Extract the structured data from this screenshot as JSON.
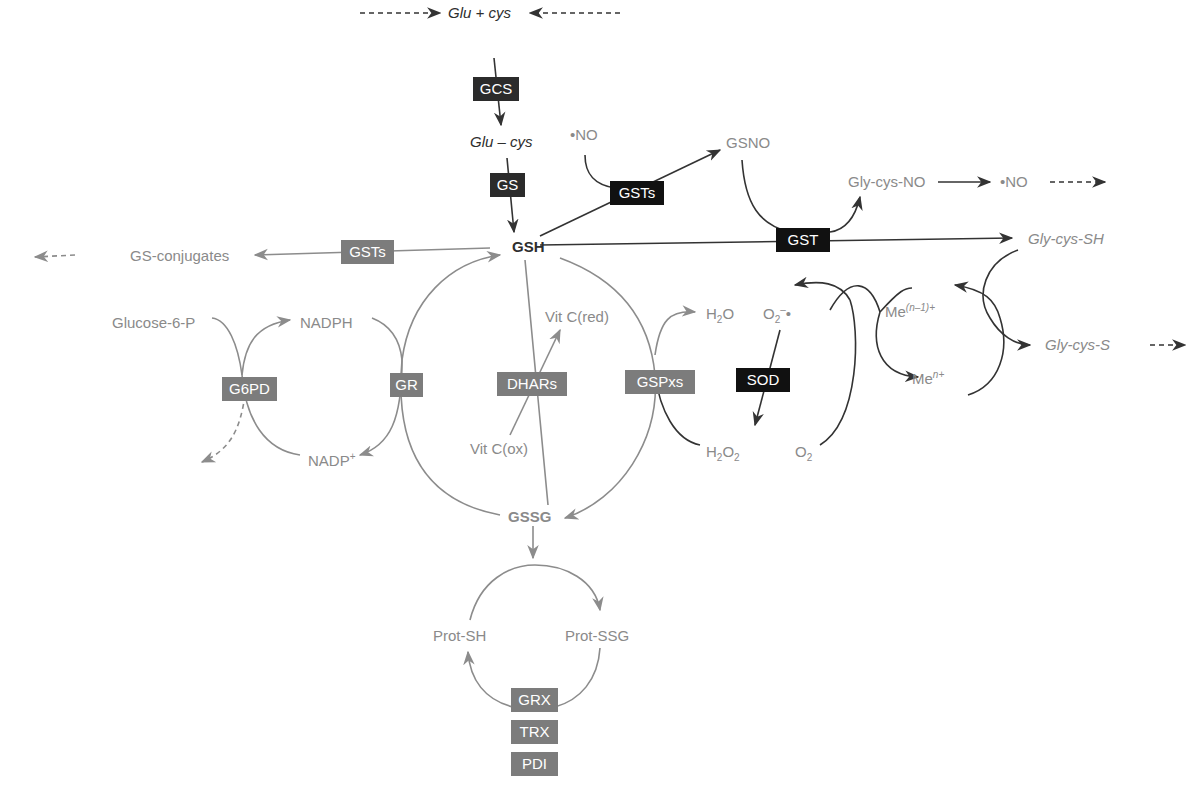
{
  "diagram": {
    "colors": {
      "dark_path": "#333333",
      "grey_path": "#8c8c8c",
      "dark_enzyme_box": "#2b2b2b",
      "grey_enzyme_box": "#7c7c7c",
      "black_enzyme_box": "#111111",
      "background": "#ffffff"
    },
    "metabolites": {
      "glu_cys": "Glu + cys",
      "glu_minus_cys": "Glu – cys",
      "no_radical_left": "•NO",
      "gsno": "GSNO",
      "gly_cys_no": "Gly-cys-NO",
      "no_radical_right": "•NO",
      "gsh": "GSH",
      "gs_conjugates": "GS-conjugates",
      "gly_cys_sh": "Gly-cys-SH",
      "gly_cys_s": "Gly-cys-S",
      "glucose_6_p": "Glucose-6-P",
      "nadph": "NADPH",
      "nadp_plus": {
        "base": "NADP",
        "sup": "+"
      },
      "vit_c_red": "Vit C(red)",
      "vit_c_ox": "Vit C(ox)",
      "h2o": {
        "a": "H",
        "sub": "2",
        "b": "O"
      },
      "h2o2": {
        "a": "H",
        "sub1": "2",
        "b": "O",
        "sub2": "2"
      },
      "superoxide": {
        "base": "O",
        "sub": "2",
        "sup": "–",
        "dot": "•"
      },
      "o2": {
        "base": "O",
        "sub": "2"
      },
      "me_n_minus_1": {
        "base": "Me",
        "sup": "(n–1)+"
      },
      "me_n": {
        "base": "Me",
        "sup": "n+"
      },
      "gssg": "GSSG",
      "prot_sh": "Prot-SH",
      "prot_ssg": "Prot-SSG"
    },
    "enzymes": {
      "gcs": "GCS",
      "gs": "GS",
      "gsts_top": "GSTs",
      "gst": "GST",
      "gsts_left": "GSTs",
      "g6pd": "G6PD",
      "gr": "GR",
      "dhars": "DHARs",
      "gspxs": "GSPxs",
      "sod": "SOD",
      "grx": "GRX",
      "trx": "TRX",
      "pdi": "PDI"
    }
  }
}
